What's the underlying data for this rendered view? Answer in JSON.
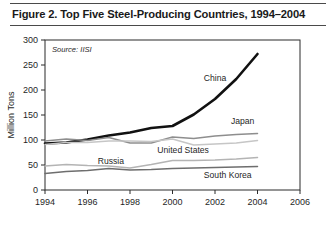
{
  "figure": {
    "title": "Figure 2. Top Five Steel-Producing Countries, 1994–2004",
    "source_note": "Source: IISI"
  },
  "chart_data": {
    "type": "line",
    "title": "Figure 2. Top Five Steel-Producing Countries, 1994–2004",
    "subtitle": "",
    "xlabel": "",
    "ylabel": "Million Tons",
    "xlim": [
      1994,
      2006
    ],
    "ylim": [
      0,
      300
    ],
    "xticks": [
      1994,
      1996,
      1998,
      2000,
      2002,
      2004,
      2006
    ],
    "yticks": [
      0,
      50,
      100,
      150,
      200,
      250,
      300
    ],
    "xtick_labels": [
      "1994",
      "1996",
      "1998",
      "2000",
      "2002",
      "2004",
      "2006"
    ],
    "ytick_labels": [
      "0",
      "50",
      "100",
      "150",
      "200",
      "250",
      "300"
    ],
    "grid": false,
    "legend": "inline-labels",
    "annotations": [
      "Source: IISI"
    ],
    "x": [
      1994,
      1995,
      1996,
      1997,
      1998,
      1999,
      2000,
      2001,
      2002,
      2003,
      2004
    ],
    "series": [
      {
        "name": "China",
        "color": "#111111",
        "width": 2.6,
        "values": [
          93,
          95,
          101,
          109,
          115,
          124,
          128,
          151,
          182,
          222,
          272
        ],
        "label": "China",
        "label_x": 2002.0,
        "label_y": 218
      },
      {
        "name": "Japan",
        "color": "#8e8e8e",
        "width": 1.5,
        "values": [
          98,
          102,
          99,
          105,
          94,
          94,
          106,
          103,
          108,
          111,
          113
        ],
        "label": "Japan",
        "label_x": 2003.3,
        "label_y": 133
      },
      {
        "name": "United States",
        "color": "#c6c6c6",
        "width": 1.5,
        "values": [
          91,
          95,
          95,
          98,
          98,
          97,
          102,
          90,
          92,
          94,
          99
        ],
        "label": "United States",
        "label_x": 2000.5,
        "label_y": 75
      },
      {
        "name": "Russia",
        "color": "#b4b4b4",
        "width": 1.5,
        "values": [
          48,
          51,
          49,
          48,
          44,
          51,
          59,
          59,
          60,
          62,
          65
        ],
        "label": "Russia",
        "label_x": 1997.1,
        "label_y": 53
      },
      {
        "name": "South Korea",
        "color": "#6e6e6e",
        "width": 1.5,
        "values": [
          33,
          37,
          39,
          43,
          40,
          41,
          43,
          44,
          45,
          46,
          47
        ],
        "label": "South Korea",
        "label_x": 2002.6,
        "label_y": 25
      }
    ]
  }
}
